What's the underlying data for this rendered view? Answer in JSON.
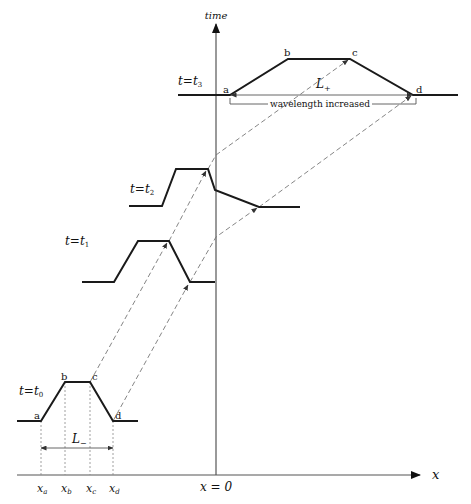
{
  "axes": {
    "y_label": "time",
    "x_label": "x",
    "origin_label": "x = 0"
  },
  "stages": [
    {
      "id": "t0",
      "label_t": "t",
      "label_eq": "=",
      "label_sub": "t",
      "label_idx": "0",
      "points": {
        "a": "a",
        "b": "b",
        "c": "c",
        "d": "d"
      }
    },
    {
      "id": "t1",
      "label_t": "t",
      "label_eq": "=",
      "label_sub": "t",
      "label_idx": "1"
    },
    {
      "id": "t2",
      "label_t": "t",
      "label_eq": "=",
      "label_sub": "t",
      "label_idx": "2"
    },
    {
      "id": "t3",
      "label_t": "t",
      "label_eq": "=",
      "label_sub": "t",
      "label_idx": "3",
      "points": {
        "a": "a",
        "b": "b",
        "c": "c",
        "d": "d"
      }
    }
  ],
  "x_ticks": [
    {
      "base": "x",
      "sub": "a"
    },
    {
      "base": "x",
      "sub": "b"
    },
    {
      "base": "x",
      "sub": "c"
    },
    {
      "base": "x",
      "sub": "d"
    }
  ],
  "lengths": {
    "initial": {
      "base": "L",
      "sub": "−"
    },
    "final": {
      "base": "L",
      "sub": "+"
    }
  },
  "annotation": "wavelength increased",
  "colors": {
    "wave": "#1a1a1a",
    "axis": "#555555",
    "dashed": "#777777"
  }
}
